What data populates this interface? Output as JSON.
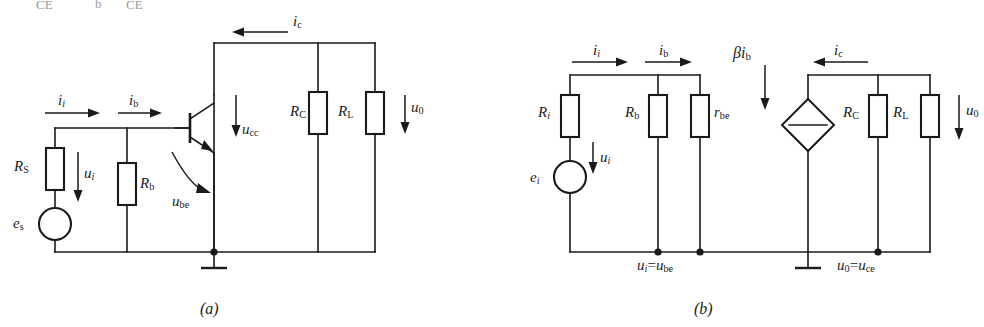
{
  "figure": {
    "background_color": "#ffffff",
    "line_color": "#1a1a1a",
    "cropped_top_text": {
      "fragment_1": "CE",
      "fragment_2": "b",
      "fragment_3": "CE"
    },
    "captions": {
      "left": "(a)",
      "right": "(b)"
    }
  },
  "circuit_a": {
    "name": "Transistor amplifier circuit",
    "caption": "(a)",
    "components": {
      "rs": {
        "label_main": "R",
        "label_sub": "S",
        "type": "resistor"
      },
      "rb": {
        "label_main": "R",
        "label_sub": "b",
        "type": "resistor"
      },
      "rc": {
        "label_main": "R",
        "label_sub": "C",
        "type": "resistor"
      },
      "rl": {
        "label_main": "R",
        "label_sub": "L",
        "type": "resistor"
      },
      "es": {
        "label_main": "e",
        "label_sub": "s",
        "type": "voltage-source"
      },
      "transistor": {
        "type": "npn-bjt"
      },
      "ground": {
        "type": "ground"
      }
    },
    "currents": {
      "ii": {
        "main": "i",
        "sub": "i",
        "sub_italic": true,
        "direction": "right"
      },
      "ib": {
        "main": "i",
        "sub": "b",
        "sub_italic": false,
        "direction": "right"
      },
      "ic": {
        "main": "i",
        "sub": "c",
        "sub_italic": false,
        "direction": "left"
      }
    },
    "voltages": {
      "ui": {
        "main": "u",
        "sub": "i",
        "sub_italic": true,
        "direction": "down"
      },
      "ucc": {
        "main": "u",
        "sub": "cc",
        "sub_italic": false,
        "direction": "down"
      },
      "ube": {
        "main": "u",
        "sub": "be",
        "sub_italic": false,
        "direction": "curved-right"
      },
      "u0": {
        "main": "u",
        "sub": "0",
        "sub_italic": false,
        "direction": "down"
      }
    }
  },
  "circuit_b": {
    "name": "Small-signal equivalent circuit",
    "caption": "(b)",
    "components": {
      "ri": {
        "label_main": "R",
        "label_sub": "i",
        "sub_italic": true,
        "type": "resistor"
      },
      "rb": {
        "label_main": "R",
        "label_sub": "b",
        "sub_italic": false,
        "type": "resistor"
      },
      "rbe": {
        "label_main": "r",
        "label_sub": "be",
        "sub_italic": false,
        "type": "resistor"
      },
      "rc": {
        "label_main": "R",
        "label_sub": "C",
        "sub_italic": false,
        "type": "resistor"
      },
      "rl": {
        "label_main": "R",
        "label_sub": "L",
        "sub_italic": false,
        "type": "resistor"
      },
      "ei": {
        "label_main": "e",
        "label_sub": "i",
        "sub_italic": true,
        "type": "voltage-source"
      },
      "dependent_source": {
        "label_main": "βi",
        "label_sub": "b",
        "type": "dependent-current-source"
      },
      "ground": {
        "type": "ground"
      }
    },
    "currents": {
      "ii": {
        "main": "i",
        "sub": "i",
        "sub_italic": true,
        "direction": "right"
      },
      "ib": {
        "main": "i",
        "sub": "b",
        "sub_italic": false,
        "direction": "right"
      },
      "ic": {
        "main": "i",
        "sub": "c",
        "sub_italic": false,
        "direction": "left"
      }
    },
    "voltages": {
      "ui": {
        "main": "u",
        "sub": "i",
        "sub_italic": true,
        "direction": "down"
      },
      "u0": {
        "main": "u",
        "sub": "0",
        "sub_italic": false,
        "direction": "down"
      }
    },
    "node_labels": {
      "input_node": {
        "lhs_main": "u",
        "lhs_sub": "i",
        "rhs_main": "u",
        "rhs_sub": "be",
        "text": "ui=ube"
      },
      "output_node": {
        "lhs_main": "u",
        "lhs_sub": "0",
        "rhs_main": "u",
        "rhs_sub": "ce",
        "text": "u0=uce"
      }
    },
    "beta_label": {
      "greek": "β",
      "main": "i",
      "sub": "b"
    }
  }
}
